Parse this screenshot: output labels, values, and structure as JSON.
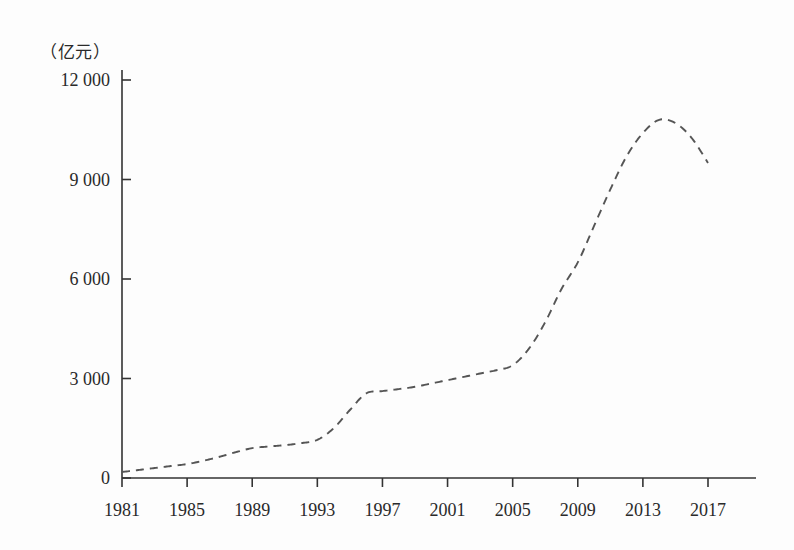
{
  "chart_data": {
    "type": "line",
    "title": "",
    "subtitle": "",
    "xlabel": "",
    "ylabel": "",
    "unit_label": "（亿元）",
    "grid": false,
    "legend": null,
    "line_style": "dashed",
    "line_color": "#555555",
    "xlim": [
      1981,
      2017
    ],
    "ylim": [
      0,
      12000
    ],
    "y_ticks": [
      0,
      3000,
      6000,
      9000,
      12000
    ],
    "y_tick_labels": [
      "0",
      "3 000",
      "6 000",
      "9 000",
      "12 000"
    ],
    "x_ticks": [
      1981,
      1985,
      1989,
      1993,
      1997,
      2001,
      2005,
      2009,
      2013,
      2017
    ],
    "x_tick_labels": [
      "1981",
      "1985",
      "1989",
      "1993",
      "1997",
      "2001",
      "2005",
      "2009",
      "2013",
      "2017"
    ],
    "series": [
      {
        "name": "",
        "x": [
          1981,
          1982,
          1983,
          1984,
          1985,
          1986,
          1987,
          1988,
          1989,
          1990,
          1991,
          1992,
          1993,
          1994,
          1995,
          1996,
          1997,
          1998,
          1999,
          2000,
          2001,
          2002,
          2003,
          2004,
          2005,
          2006,
          2007,
          2008,
          2009,
          2010,
          2011,
          2012,
          2013,
          2014,
          2015,
          2016,
          2017
        ],
        "values": [
          180,
          240,
          300,
          360,
          420,
          520,
          640,
          780,
          900,
          950,
          990,
          1050,
          1150,
          1500,
          2050,
          2550,
          2620,
          2680,
          2750,
          2850,
          2950,
          3050,
          3150,
          3250,
          3400,
          3900,
          4700,
          5700,
          6500,
          7600,
          8700,
          9700,
          10400,
          10800,
          10700,
          10250,
          9500
        ]
      }
    ]
  },
  "axes": {
    "y_axis_name": "y-axis",
    "x_axis_name": "x-axis"
  }
}
